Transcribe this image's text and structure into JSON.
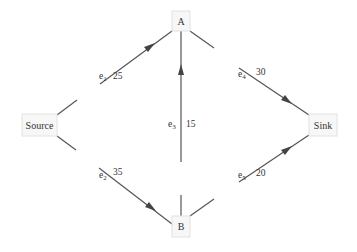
{
  "diagram": {
    "type": "flow-network",
    "nodes": [
      {
        "id": "source",
        "label": "Source"
      },
      {
        "id": "A",
        "label": "A"
      },
      {
        "id": "B",
        "label": "B"
      },
      {
        "id": "sink",
        "label": "Sink"
      }
    ],
    "edges": [
      {
        "id": "e1",
        "name": "e",
        "sub": "1",
        "from": "Source",
        "to": "A",
        "capacity": "25"
      },
      {
        "id": "e2",
        "name": "e",
        "sub": "2",
        "from": "Source",
        "to": "B",
        "capacity": "35"
      },
      {
        "id": "e3",
        "name": "e",
        "sub": "3",
        "from": "B",
        "to": "A",
        "capacity": "15"
      },
      {
        "id": "e4",
        "name": "e",
        "sub": "4",
        "from": "A",
        "to": "Sink",
        "capacity": "30"
      },
      {
        "id": "e5",
        "name": "e",
        "sub": "5",
        "from": "B",
        "to": "Sink",
        "capacity": "20"
      }
    ],
    "colors": {
      "edge": "#555555",
      "node_fill": "#f7f7f7",
      "node_border": "#e2e2e2",
      "text": "#333333"
    }
  }
}
